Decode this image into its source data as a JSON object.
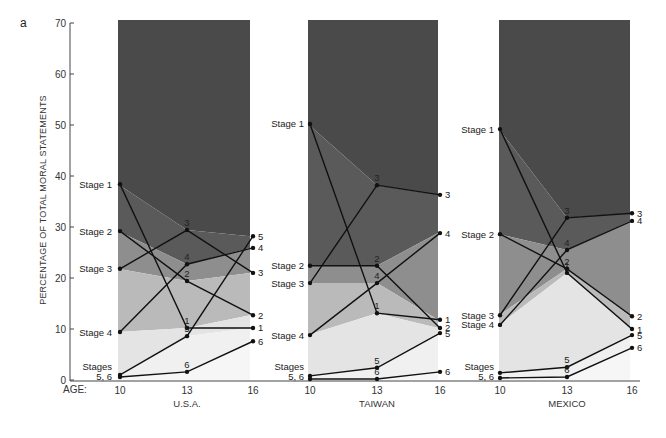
{
  "chart_data": {
    "type": "line",
    "panel_letter": "a",
    "ylabel": "PERCENTAGE OF TOTAL MORAL STATEMENTS",
    "xlabel": "AGE:",
    "ylim": [
      0,
      70
    ],
    "yticks": [
      0,
      10,
      20,
      30,
      40,
      50,
      60,
      70
    ],
    "x": [
      10,
      13,
      16
    ],
    "band_colors": [
      "#4a4a4a",
      "#5e5e5e",
      "#8c8c8c",
      "#bcbcbc",
      "#e6e6e6",
      "#f2f2f2"
    ],
    "line_color": "#111111",
    "panels": [
      {
        "country": "U.S.A.",
        "series": [
          {
            "name": "Stage 1",
            "short": "1",
            "values": [
              38.4,
              10.2,
              10.2
            ]
          },
          {
            "name": "Stage 2",
            "short": "2",
            "values": [
              29.2,
              19.4,
              12.7
            ]
          },
          {
            "name": "Stage 3",
            "short": "3",
            "values": [
              21.8,
              29.4,
              21.0
            ]
          },
          {
            "name": "Stage 4",
            "short": "4",
            "values": [
              9.4,
              22.7,
              25.9
            ]
          },
          {
            "name": "Stage 5",
            "short": "5",
            "values": [
              1.0,
              8.6,
              28.2
            ]
          },
          {
            "name": "Stage 6",
            "short": "6",
            "values": [
              0.6,
              1.6,
              7.6
            ]
          }
        ]
      },
      {
        "country": "TAIWAN",
        "series": [
          {
            "name": "Stage 1",
            "short": "1",
            "values": [
              50.2,
              13.1,
              11.8
            ]
          },
          {
            "name": "Stage 2",
            "short": "2",
            "values": [
              22.4,
              22.4,
              10.2
            ]
          },
          {
            "name": "Stage 3",
            "short": "3",
            "values": [
              19.0,
              38.2,
              36.3
            ]
          },
          {
            "name": "Stage 4",
            "short": "4",
            "values": [
              8.8,
              19.0,
              28.8
            ]
          },
          {
            "name": "Stage 5",
            "short": "5",
            "values": [
              0.8,
              2.4,
              9.2
            ]
          },
          {
            "name": "Stage 6",
            "short": "6",
            "values": [
              0.2,
              0.2,
              1.6
            ]
          }
        ]
      },
      {
        "country": "MEXICO",
        "series": [
          {
            "name": "Stage 1",
            "short": "1",
            "values": [
              49.2,
              21.0,
              10.0
            ]
          },
          {
            "name": "Stage 2",
            "short": "2",
            "values": [
              28.6,
              21.8,
              12.5
            ]
          },
          {
            "name": "Stage 3",
            "short": "3",
            "values": [
              12.7,
              31.8,
              32.7
            ]
          },
          {
            "name": "Stage 4",
            "short": "4",
            "values": [
              10.8,
              25.5,
              31.2
            ]
          },
          {
            "name": "Stage 5",
            "short": "5",
            "values": [
              1.4,
              2.5,
              8.8
            ]
          },
          {
            "name": "Stage 6",
            "short": "6",
            "values": [
              0.4,
              0.6,
              6.3
            ]
          }
        ]
      }
    ],
    "left_labels": {
      "U.S.A.": [
        "Stage 1",
        "Stage 2",
        "Stage 3",
        "Stage 4",
        "Stages",
        "5, 6"
      ],
      "TAIWAN": [
        "Stage 1",
        "Stage 2",
        "Stage 3",
        "Stage 4",
        "Stages",
        "5, 6"
      ],
      "MEXICO": [
        "Stage 1",
        "Stage 2",
        "Stage 3",
        "Stage 4",
        "Stages",
        "5, 6"
      ]
    }
  }
}
